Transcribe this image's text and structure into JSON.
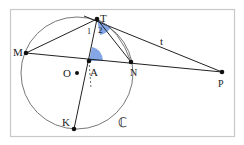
{
  "diagram": {
    "points": {
      "T": {
        "label": "T",
        "x": 97,
        "y": 19
      },
      "M": {
        "label": "M",
        "x": 26,
        "y": 53
      },
      "A": {
        "label": "A",
        "x": 89,
        "y": 61
      },
      "N": {
        "label": "N",
        "x": 131,
        "y": 62
      },
      "P": {
        "label": "P",
        "x": 222,
        "y": 72
      },
      "O": {
        "label": "O",
        "x": 77,
        "y": 73
      },
      "K": {
        "label": "K",
        "x": 74,
        "y": 129
      }
    },
    "circle_label": "ℂ",
    "tangent_label": "t",
    "angle_labels": {
      "one": "1",
      "two": "2"
    },
    "colors": {
      "angle_fill": "#6f96e0",
      "line": "#222222",
      "frame": "#c8c8c8"
    }
  }
}
